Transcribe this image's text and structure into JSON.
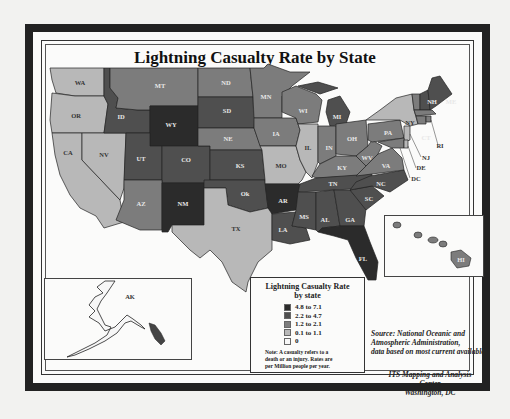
{
  "map": {
    "title": "Lightning Casualty Rate by State",
    "legend": {
      "title_line1": "Lightning Casualty Rate",
      "title_line2": "by state",
      "classes": [
        {
          "label": "4.8 to 7.1",
          "color": "#2b2b2b"
        },
        {
          "label": "2.2 to 4.7",
          "color": "#4f4f4f"
        },
        {
          "label": "1.2 to 2.1",
          "color": "#7c7c7c"
        },
        {
          "label": "0.1 to 1.1",
          "color": "#b8b8b8"
        },
        {
          "label": "0",
          "color": "#f7f7f7"
        }
      ],
      "note_line1": "Note: A casualty refers to a",
      "note_line2": "death or an injury.  Rates are",
      "note_line3": "per Million people per year."
    },
    "source": {
      "line1": "Source: National Oceanic and",
      "line2": "Atmospheric Administration,",
      "line3": "data based on most current available"
    },
    "credit": {
      "line1": "ITS Mapping and Analysis Center",
      "line2": "Washington, DC"
    },
    "states": {
      "WA": "0.1 to 1.1",
      "OR": "0.1 to 1.1",
      "CA": "0.1 to 1.1",
      "NV": "0.1 to 1.1",
      "ID": "2.2 to 4.7",
      "MT": "1.2 to 2.1",
      "WY": "4.8 to 7.1",
      "UT": "2.2 to 4.7",
      "CO": "2.2 to 4.7",
      "AZ": "1.2 to 2.1",
      "NM": "4.8 to 7.1",
      "ND": "1.2 to 2.1",
      "SD": "2.2 to 4.7",
      "NE": "1.2 to 2.1",
      "KS": "2.2 to 4.7",
      "OK": "2.2 to 4.7",
      "TX": "0.1 to 1.1",
      "MN": "1.2 to 2.1",
      "IA": "1.2 to 2.1",
      "MO": "0.1 to 1.1",
      "AR": "4.8 to 7.1",
      "LA": "2.2 to 4.7",
      "WI": "1.2 to 2.1",
      "IL": "0.1 to 1.1",
      "MI": "2.2 to 4.7",
      "IN": "1.2 to 2.1",
      "OH": "1.2 to 2.1",
      "KY": "1.2 to 2.1",
      "TN": "2.2 to 4.7",
      "MS": "2.2 to 4.7",
      "AL": "2.2 to 4.7",
      "GA": "2.2 to 4.7",
      "FL": "4.8 to 7.1",
      "SC": "2.2 to 4.7",
      "NC": "2.2 to 4.7",
      "VA": "1.2 to 2.1",
      "WV": "1.2 to 2.1",
      "PA": "1.2 to 2.1",
      "NY": "0.1 to 1.1",
      "VT": "1.2 to 2.1",
      "NH": "2.2 to 4.7",
      "ME": "2.2 to 4.7",
      "MA": "1.2 to 2.1",
      "CT": "1.2 to 2.1",
      "RI": "1.2 to 2.1",
      "NJ": "0.1 to 1.1",
      "DE": "0.1 to 1.1",
      "MD": "1.2 to 2.1",
      "DC": "0.1 to 1.1",
      "AK": "0",
      "HI": "1.2 to 2.1"
    },
    "labels": {
      "WA": "WA",
      "OR": "OR",
      "CA": "CA",
      "NV": "NV",
      "ID": "ID",
      "MT": "MT",
      "WY": "WY",
      "UT": "UT",
      "CO": "CO",
      "AZ": "AZ",
      "NM": "NM",
      "ND": "ND",
      "SD": "SD",
      "NE": "NE",
      "KS": "KS",
      "OK": "Ok",
      "TX": "TX",
      "MN": "MN",
      "IA": "IA",
      "MO": "MO",
      "AR": "AR",
      "LA": "LA",
      "WI": "WI",
      "IL": "IL",
      "MI": "MI",
      "IN": "IN",
      "OH": "OH",
      "KY": "KY",
      "TN": "TN",
      "MS": "MS",
      "AL": "AL",
      "GA": "GA",
      "FL": "FL",
      "SC": "SC",
      "NC": "NC",
      "VA": "VA",
      "WV": "WV",
      "PA": "PA",
      "NY": "NY",
      "VT": "VT",
      "NH": "NH",
      "ME": "ME",
      "MA": "MA",
      "CT": "CT",
      "RI": "RI",
      "NJ": "NJ",
      "DE": "DE",
      "DC": "DC",
      "AK": "AK",
      "HI": "HI"
    }
  }
}
